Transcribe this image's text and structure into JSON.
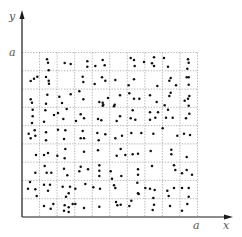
{
  "diagram": {
    "title": "",
    "labels": {
      "y_axis": "y",
      "x_axis": "x",
      "y_max": "a",
      "x_max": "a"
    },
    "grid": {
      "columns": 10,
      "rows": 9,
      "style": "dotted"
    },
    "colors": {
      "points": "#111111",
      "axes": "#1a1a1a",
      "grid": "#9a9a9a",
      "labels": "#555555"
    },
    "points": [
      [
        47,
        59.3
      ],
      [
        48,
        62.7
      ],
      [
        48.7,
        70.3
      ],
      [
        64.7,
        63
      ],
      [
        70.7,
        64
      ],
      [
        30.7,
        81
      ],
      [
        34,
        78.7
      ],
      [
        37.3,
        76.7
      ],
      [
        46,
        77
      ],
      [
        48.7,
        80.7
      ],
      [
        49,
        83.7
      ],
      [
        30.7,
        99.3
      ],
      [
        32,
        102.7
      ],
      [
        47.3,
        94.7
      ],
      [
        46,
        103.7
      ],
      [
        59.3,
        96.7
      ],
      [
        62,
        103
      ],
      [
        70.7,
        94.3
      ],
      [
        79.3,
        91.3
      ],
      [
        87.3,
        61.3
      ],
      [
        87.3,
        66.7
      ],
      [
        95.3,
        66
      ],
      [
        102.7,
        60
      ],
      [
        104.7,
        65.3
      ],
      [
        130.7,
        58
      ],
      [
        134,
        60
      ],
      [
        134.7,
        66
      ],
      [
        82.7,
        76.7
      ],
      [
        83.3,
        82
      ],
      [
        94.7,
        84
      ],
      [
        102,
        77.3
      ],
      [
        105.3,
        80.7
      ],
      [
        115.3,
        80
      ],
      [
        128.7,
        85.3
      ],
      [
        134,
        79.3
      ],
      [
        83.3,
        99.3
      ],
      [
        99.3,
        102
      ],
      [
        102.7,
        102.7
      ],
      [
        103.3,
        104.7
      ],
      [
        108,
        98
      ],
      [
        114.7,
        104.7
      ],
      [
        120,
        95.3
      ],
      [
        129.3,
        93.3
      ],
      [
        134,
        98.7
      ],
      [
        144,
        62
      ],
      [
        152,
        63.3
      ],
      [
        154,
        57.3
      ],
      [
        154,
        66
      ],
      [
        164,
        58
      ],
      [
        168,
        66.7
      ],
      [
        188,
        59.3
      ],
      [
        187.3,
        68.7
      ],
      [
        188.7,
        62.7
      ],
      [
        157.3,
        86
      ],
      [
        169.3,
        80.7
      ],
      [
        170.7,
        78
      ],
      [
        176,
        85.3
      ],
      [
        186.7,
        77.3
      ],
      [
        188.7,
        77.3
      ],
      [
        188.7,
        84.7
      ],
      [
        139.3,
        98.7
      ],
      [
        150,
        95.3
      ],
      [
        156.7,
        102
      ],
      [
        164.7,
        105.3
      ],
      [
        169.3,
        96
      ],
      [
        170.7,
        92.7
      ],
      [
        184.7,
        100.7
      ],
      [
        188,
        98.7
      ],
      [
        189.3,
        96
      ],
      [
        32.7,
        109.7
      ],
      [
        32.7,
        116.3
      ],
      [
        32,
        123
      ],
      [
        45.3,
        110.3
      ],
      [
        44,
        121.7
      ],
      [
        54,
        115
      ],
      [
        58,
        113
      ],
      [
        63.3,
        119
      ],
      [
        66.7,
        109
      ],
      [
        76,
        121
      ],
      [
        28.7,
        133.7
      ],
      [
        34.7,
        130.3
      ],
      [
        35.3,
        135.7
      ],
      [
        30.7,
        138.3
      ],
      [
        46,
        132.3
      ],
      [
        46,
        140.3
      ],
      [
        58,
        129.7
      ],
      [
        64,
        139
      ],
      [
        65.3,
        130.3
      ],
      [
        36,
        155
      ],
      [
        44,
        155
      ],
      [
        48,
        153
      ],
      [
        57.3,
        155.7
      ],
      [
        64.7,
        158.3
      ],
      [
        65.3,
        149
      ],
      [
        102.7,
        105.7
      ],
      [
        114,
        106.3
      ],
      [
        80.7,
        114.3
      ],
      [
        84,
        118.3
      ],
      [
        98,
        119
      ],
      [
        101.3,
        120.3
      ],
      [
        116.7,
        121
      ],
      [
        120,
        116.3
      ],
      [
        132.7,
        110.3
      ],
      [
        130.7,
        118.3
      ],
      [
        135.3,
        119.7
      ],
      [
        82.7,
        131
      ],
      [
        80.7,
        138.3
      ],
      [
        84,
        138.3
      ],
      [
        97.3,
        133
      ],
      [
        98.7,
        140.3
      ],
      [
        105.3,
        134.3
      ],
      [
        115.3,
        138.3
      ],
      [
        122,
        135.7
      ],
      [
        131.3,
        133
      ],
      [
        84,
        151.7
      ],
      [
        98,
        150.3
      ],
      [
        116.7,
        155.7
      ],
      [
        120.7,
        149
      ],
      [
        125.3,
        155
      ],
      [
        132.7,
        154.3
      ],
      [
        138,
        153.7
      ],
      [
        150,
        112.3
      ],
      [
        150,
        119.7
      ],
      [
        155.3,
        117.7
      ],
      [
        158,
        112.3
      ],
      [
        168,
        109.7
      ],
      [
        166,
        117.7
      ],
      [
        172.7,
        117.7
      ],
      [
        188.7,
        105.7
      ],
      [
        189.3,
        113.7
      ],
      [
        186,
        118.3
      ],
      [
        141.3,
        133
      ],
      [
        153.3,
        133.7
      ],
      [
        162.7,
        128.3
      ],
      [
        177.3,
        135.7
      ],
      [
        184,
        133.7
      ],
      [
        190,
        135
      ],
      [
        150.7,
        151
      ],
      [
        171.3,
        149.7
      ],
      [
        171.3,
        154.3
      ],
      [
        186.7,
        157
      ],
      [
        35.3,
        172.7
      ],
      [
        44.7,
        166
      ],
      [
        46.7,
        172.7
      ],
      [
        51.3,
        172.7
      ],
      [
        64,
        168.7
      ],
      [
        67.3,
        175.3
      ],
      [
        79.3,
        171.3
      ],
      [
        30,
        182
      ],
      [
        28,
        188.7
      ],
      [
        35.3,
        189.3
      ],
      [
        36.7,
        196
      ],
      [
        44,
        184.7
      ],
      [
        48,
        190.7
      ],
      [
        50,
        184.7
      ],
      [
        62.7,
        186.7
      ],
      [
        70,
        186.7
      ],
      [
        68.7,
        193.3
      ],
      [
        66,
        196.7
      ],
      [
        75.3,
        188.7
      ],
      [
        44,
        206
      ],
      [
        50.7,
        208.7
      ],
      [
        53.3,
        204
      ],
      [
        64.7,
        205.3
      ],
      [
        64,
        210.7
      ],
      [
        68.7,
        207.3
      ],
      [
        68.7,
        212
      ],
      [
        72.7,
        204
      ],
      [
        75.3,
        204
      ],
      [
        80.7,
        166.7
      ],
      [
        88,
        169.3
      ],
      [
        99.3,
        165.3
      ],
      [
        99.3,
        170.7
      ],
      [
        99.3,
        176
      ],
      [
        110.7,
        171.3
      ],
      [
        121.3,
        176
      ],
      [
        85.3,
        184
      ],
      [
        93.3,
        187.3
      ],
      [
        100,
        188.7
      ],
      [
        112,
        178.7
      ],
      [
        114,
        185.3
      ],
      [
        115.3,
        188
      ],
      [
        137.3,
        182.7
      ],
      [
        138,
        193.3
      ],
      [
        84,
        208
      ],
      [
        99.3,
        206.7
      ],
      [
        116,
        202
      ],
      [
        117.3,
        205.3
      ],
      [
        120.7,
        204.7
      ],
      [
        129.3,
        206
      ],
      [
        131.3,
        200.7
      ],
      [
        152,
        166
      ],
      [
        138,
        169.3
      ],
      [
        138,
        174.7
      ],
      [
        174,
        165.3
      ],
      [
        175.3,
        170
      ],
      [
        182,
        173.3
      ],
      [
        186.7,
        170
      ],
      [
        192,
        174.7
      ],
      [
        145.3,
        188
      ],
      [
        150,
        188.7
      ],
      [
        154.7,
        190
      ],
      [
        138.7,
        194
      ],
      [
        167.3,
        190.7
      ],
      [
        174,
        188
      ],
      [
        182,
        188
      ],
      [
        188.7,
        188
      ],
      [
        168.7,
        196
      ],
      [
        188.7,
        196.7
      ],
      [
        153.3,
        198
      ],
      [
        154,
        204.7
      ],
      [
        152.7,
        210
      ],
      [
        170,
        206
      ],
      [
        187.3,
        204
      ],
      [
        182,
        210.7
      ]
    ]
  }
}
